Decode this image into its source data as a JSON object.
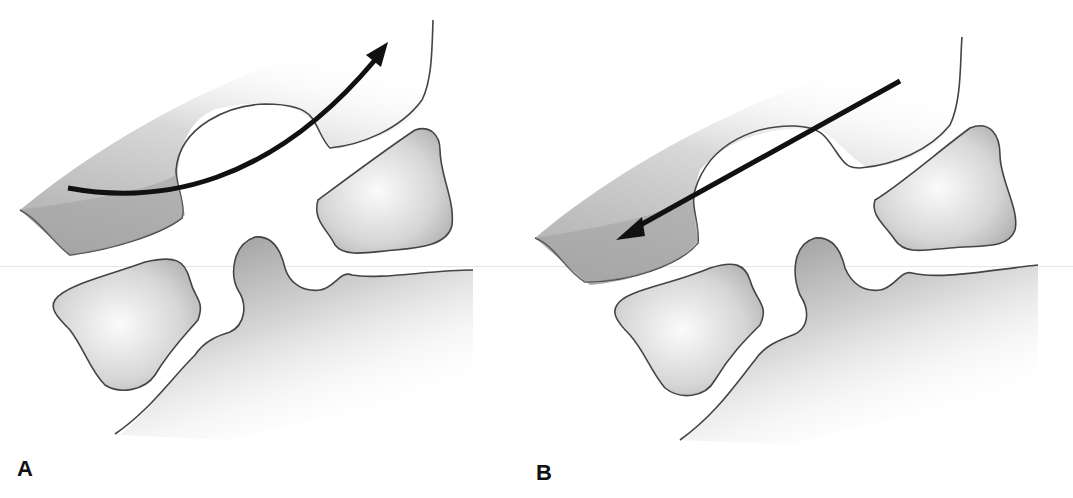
{
  "figure": {
    "panels": [
      {
        "id": "A",
        "label": "A",
        "arrow": "curved-arrow-up-right"
      },
      {
        "id": "B",
        "label": "B",
        "arrow": "straight-arrow-down-left"
      }
    ],
    "colors": {
      "outline": "#444444",
      "fill_dark": "#9a9a9a",
      "fill_light": "#f4f4f4",
      "arrow": "#111111",
      "background": "#ffffff"
    }
  }
}
